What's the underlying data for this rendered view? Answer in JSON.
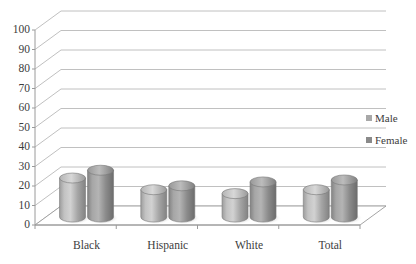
{
  "chart_data": {
    "type": "bar",
    "title": "",
    "subtitle": "",
    "xlabel": "",
    "ylabel": "",
    "categories": [
      "Black",
      "Hispanic",
      "White",
      "Total"
    ],
    "series": [
      {
        "name": "Male",
        "values": [
          20,
          14,
          12,
          14
        ],
        "color": "#a8a8a8"
      },
      {
        "name": "Female",
        "values": [
          24,
          16,
          18,
          19
        ],
        "color": "#8a8a8a"
      }
    ],
    "ylim": [
      0,
      100
    ],
    "ytick_step": 10,
    "ytick_labels": [
      "0",
      "10",
      "20",
      "30",
      "40",
      "50",
      "60",
      "70",
      "80",
      "90",
      "100"
    ],
    "grid": true,
    "grid_color": "#b9b9b9",
    "legend_position": "right",
    "three_d": true,
    "bar_shape": "cylinder",
    "background": "#ffffff",
    "axis_color": "#9a9a9a",
    "text_color": "#3c3c3c"
  },
  "legend": {
    "items": [
      {
        "label": "Male",
        "swatch": "#a8a8a8",
        "icon": "legend-square-icon"
      },
      {
        "label": "Female",
        "swatch": "#8a8a8a",
        "icon": "legend-square-icon"
      }
    ]
  },
  "axes": {
    "y": {
      "ticks": [
        "100",
        "90",
        "80",
        "70",
        "60",
        "50",
        "40",
        "30",
        "20",
        "10",
        "0"
      ]
    },
    "x": {
      "ticks": [
        "Black",
        "Hispanic",
        "White",
        "Total"
      ]
    }
  }
}
